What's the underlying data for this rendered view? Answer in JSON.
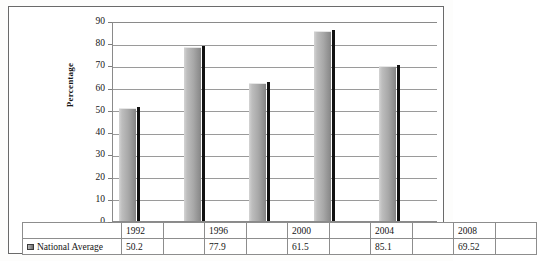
{
  "chart_data": {
    "type": "bar",
    "title": "",
    "xlabel": "",
    "ylabel": "Percentage",
    "categories": [
      "1992",
      "1996",
      "2000",
      "2004",
      "2008"
    ],
    "series": [
      {
        "name": "National Average",
        "values": [
          50.2,
          77.9,
          61.5,
          85.1,
          69.52
        ]
      }
    ],
    "ylim": [
      0,
      90
    ],
    "ytick_step": 10,
    "yticks": [
      "90",
      "80",
      "70",
      "60",
      "50",
      "40",
      "30",
      "20",
      "10",
      "0"
    ],
    "grid": true,
    "legend_position": "data-table-row",
    "data_table": {
      "visible": true,
      "row_label": "National Average",
      "cells": [
        "50.2",
        "77.9",
        "61.5",
        "85.1",
        "69.52"
      ]
    },
    "colors": {
      "bar_light": "#d4d4d4",
      "bar_dark": "#848484",
      "bar_shadow": "#111111",
      "gridline": "#9a9a9a",
      "border": "#6a6a6a",
      "text": "#141414",
      "plot_background": "#ffffff"
    }
  },
  "legend": {
    "marker_name": "series-color-swatch",
    "label": "National Average"
  }
}
